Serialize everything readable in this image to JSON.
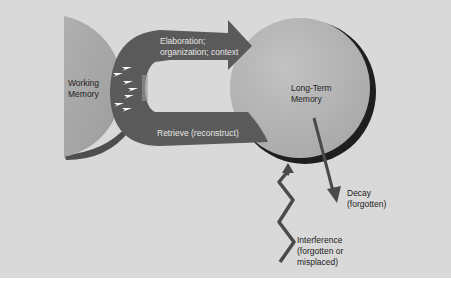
{
  "diagram": {
    "working_memory": {
      "label": "Working\nMemory"
    },
    "long_term_memory": {
      "label": "Long-Term\nMemory"
    },
    "encode_arrow": {
      "label": "Elaboration;\norganization; context"
    },
    "retrieve_band": {
      "label": "Retrieve (reconstruct)"
    },
    "decay": {
      "label": "Decay\n(forgotten)"
    },
    "interference": {
      "label": "Interference\n(forgotten or\nmisplaced)"
    },
    "colors": {
      "background": "#d9d9d9",
      "band": "#5a5a5a",
      "working_memory": "#a8a8a8",
      "long_term_memory": "#b5b5b5",
      "arrow_marks": "#ffffff"
    }
  }
}
